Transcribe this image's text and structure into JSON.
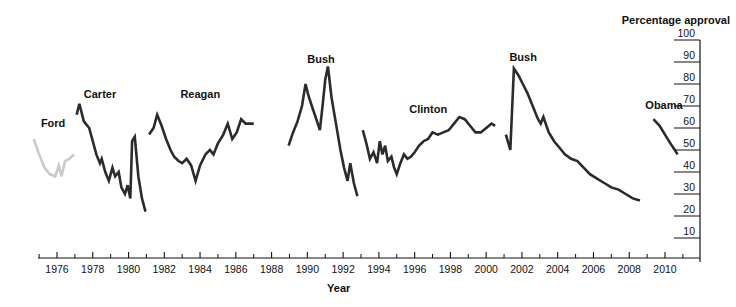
{
  "chart_data": {
    "type": "line",
    "title": "",
    "xlabel": "Year",
    "ylabel": "Percentage approval",
    "xlim": [
      1974.0,
      2011.5
    ],
    "ylim": [
      0,
      100
    ],
    "grid": false,
    "legend_position": "inline-labels",
    "x_ticks": [
      1976,
      1978,
      1980,
      1982,
      1984,
      1986,
      1988,
      1990,
      1992,
      1994,
      1996,
      1998,
      2000,
      2002,
      2004,
      2006,
      2008,
      2010
    ],
    "x_tick_labels": [
      "1976",
      "1978",
      "1980",
      "1982",
      "1984",
      "1986",
      "1988",
      "1990",
      "1992",
      "1994",
      "1996",
      "1998",
      "2000",
      "2002",
      "2004",
      "2006",
      "2008",
      "2010"
    ],
    "x_minor_ticks": [
      1975,
      1977,
      1979,
      1981,
      1983,
      1985,
      1987,
      1989,
      1991,
      1993,
      1995,
      1997,
      1999,
      2001,
      2003,
      2005,
      2007,
      2009,
      2011
    ],
    "y_ticks": [
      10,
      20,
      30,
      40,
      50,
      60,
      70,
      80,
      90,
      100
    ],
    "y_tick_labels": [
      "10",
      "20",
      "30",
      "40",
      "50",
      "60",
      "70",
      "80",
      "90",
      "100"
    ],
    "axis_side_y": "right",
    "series": [
      {
        "name": "Ford",
        "color": "#c9c9c9",
        "label": "Ford",
        "label_x": 1975.1,
        "label_y": 62,
        "points": [
          [
            1974.7,
            55
          ],
          [
            1975.0,
            48
          ],
          [
            1975.3,
            42
          ],
          [
            1975.6,
            39
          ],
          [
            1975.9,
            38
          ],
          [
            1976.1,
            43
          ],
          [
            1976.25,
            38
          ],
          [
            1976.45,
            45
          ],
          [
            1976.7,
            46
          ],
          [
            1976.95,
            48
          ]
        ]
      },
      {
        "name": "Carter",
        "color": "#2b2b2b",
        "label": "Carter",
        "label_x": 1977.5,
        "label_y": 75,
        "points": [
          [
            1977.1,
            66
          ],
          [
            1977.25,
            71
          ],
          [
            1977.5,
            63
          ],
          [
            1977.8,
            60
          ],
          [
            1978.0,
            54
          ],
          [
            1978.2,
            48
          ],
          [
            1978.4,
            44
          ],
          [
            1978.5,
            46
          ],
          [
            1978.7,
            40
          ],
          [
            1978.9,
            36
          ],
          [
            1979.1,
            42
          ],
          [
            1979.25,
            38
          ],
          [
            1979.45,
            40
          ],
          [
            1979.6,
            33
          ],
          [
            1979.8,
            30
          ],
          [
            1979.95,
            34
          ],
          [
            1980.1,
            28
          ],
          [
            1980.2,
            54
          ],
          [
            1980.35,
            56
          ],
          [
            1980.55,
            38
          ],
          [
            1980.75,
            28
          ],
          [
            1980.95,
            22
          ]
        ]
      },
      {
        "name": "Reagan",
        "color": "#2b2b2b",
        "label": "Reagan",
        "label_x": 1982.9,
        "label_y": 75,
        "points": [
          [
            1981.15,
            57
          ],
          [
            1981.4,
            60
          ],
          [
            1981.6,
            66
          ],
          [
            1981.85,
            61
          ],
          [
            1982.1,
            55
          ],
          [
            1982.35,
            50
          ],
          [
            1982.55,
            47
          ],
          [
            1982.8,
            45
          ],
          [
            1983.0,
            44
          ],
          [
            1983.25,
            46
          ],
          [
            1983.5,
            43
          ],
          [
            1983.75,
            36
          ],
          [
            1984.0,
            43
          ],
          [
            1984.3,
            48
          ],
          [
            1984.55,
            50
          ],
          [
            1984.75,
            48
          ],
          [
            1985.0,
            53
          ],
          [
            1985.3,
            57
          ],
          [
            1985.55,
            62
          ],
          [
            1985.8,
            55
          ],
          [
            1986.05,
            58
          ],
          [
            1986.3,
            64
          ],
          [
            1986.55,
            62
          ],
          [
            1986.8,
            62
          ],
          [
            1987.0,
            62
          ]
        ]
      },
      {
        "name": "Bush",
        "color": "#2b2b2b",
        "label": "Bush",
        "label_x": 1990.0,
        "label_y": 91,
        "points": [
          [
            1988.95,
            52
          ],
          [
            1989.2,
            58
          ],
          [
            1989.45,
            63
          ],
          [
            1989.7,
            70
          ],
          [
            1989.9,
            80
          ],
          [
            1990.05,
            75
          ],
          [
            1990.25,
            70
          ],
          [
            1990.5,
            64
          ],
          [
            1990.7,
            59
          ],
          [
            1990.85,
            70
          ],
          [
            1991.0,
            82
          ],
          [
            1991.15,
            88
          ],
          [
            1991.35,
            74
          ],
          [
            1991.6,
            62
          ],
          [
            1991.85,
            50
          ],
          [
            1992.05,
            42
          ],
          [
            1992.25,
            36
          ],
          [
            1992.4,
            44
          ],
          [
            1992.6,
            35
          ],
          [
            1992.8,
            29
          ]
        ]
      },
      {
        "name": "Clinton",
        "color": "#2b2b2b",
        "label": "Clinton",
        "label_x": 1995.7,
        "label_y": 68,
        "points": [
          [
            1993.1,
            59
          ],
          [
            1993.3,
            53
          ],
          [
            1993.5,
            46
          ],
          [
            1993.7,
            49
          ],
          [
            1993.9,
            44
          ],
          [
            1994.05,
            54
          ],
          [
            1994.2,
            48
          ],
          [
            1994.35,
            52
          ],
          [
            1994.5,
            45
          ],
          [
            1994.7,
            47
          ],
          [
            1994.85,
            42
          ],
          [
            1995.0,
            39
          ],
          [
            1995.2,
            44
          ],
          [
            1995.4,
            48
          ],
          [
            1995.6,
            46
          ],
          [
            1995.8,
            47
          ],
          [
            1996.0,
            49
          ],
          [
            1996.25,
            52
          ],
          [
            1996.5,
            54
          ],
          [
            1996.75,
            55
          ],
          [
            1997.0,
            58
          ],
          [
            1997.3,
            57
          ],
          [
            1997.6,
            58
          ],
          [
            1997.9,
            59
          ],
          [
            1998.2,
            62
          ],
          [
            1998.5,
            65
          ],
          [
            1998.8,
            64
          ],
          [
            1999.1,
            61
          ],
          [
            1999.4,
            58
          ],
          [
            1999.7,
            58
          ],
          [
            2000.0,
            60
          ],
          [
            2000.3,
            62
          ],
          [
            2000.5,
            61
          ]
        ]
      },
      {
        "name": "Bush",
        "color": "#2b2b2b",
        "label": "Bush",
        "label_x": 2001.3,
        "label_y": 92,
        "points": [
          [
            2001.1,
            57
          ],
          [
            2001.35,
            50
          ],
          [
            2001.55,
            87
          ],
          [
            2001.8,
            84
          ],
          [
            2002.05,
            80
          ],
          [
            2002.3,
            76
          ],
          [
            2002.6,
            70
          ],
          [
            2002.9,
            64
          ],
          [
            2003.05,
            62
          ],
          [
            2003.2,
            65
          ],
          [
            2003.5,
            58
          ],
          [
            2003.8,
            54
          ],
          [
            2004.1,
            51
          ],
          [
            2004.4,
            48
          ],
          [
            2004.75,
            46
          ],
          [
            2005.1,
            45
          ],
          [
            2005.45,
            42
          ],
          [
            2005.8,
            39
          ],
          [
            2006.2,
            37
          ],
          [
            2006.6,
            35
          ],
          [
            2007.0,
            33
          ],
          [
            2007.4,
            32
          ],
          [
            2007.8,
            30
          ],
          [
            2008.2,
            28
          ],
          [
            2008.6,
            27
          ]
        ]
      },
      {
        "name": "Obama",
        "color": "#2b2b2b",
        "label": "Obama",
        "label_x": 2008.9,
        "label_y": 70,
        "points": [
          [
            2009.35,
            64
          ],
          [
            2009.7,
            61
          ],
          [
            2010.0,
            57
          ],
          [
            2010.3,
            53
          ],
          [
            2010.55,
            50
          ],
          [
            2010.7,
            48
          ]
        ]
      }
    ]
  }
}
